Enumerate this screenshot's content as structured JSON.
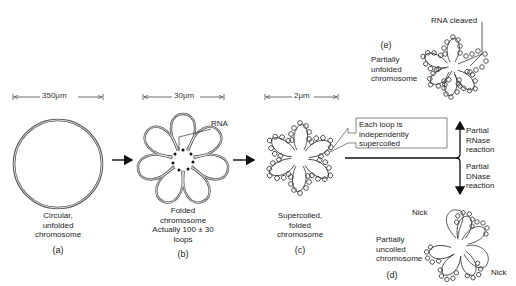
{
  "figure": {
    "scale_bars": [
      {
        "id": "a",
        "label": "350μm"
      },
      {
        "id": "b",
        "label": "30μm"
      },
      {
        "id": "c",
        "label": "2μm"
      }
    ],
    "panels": {
      "a": {
        "tag": "(a)",
        "caption": [
          "Circular,",
          "unfolded",
          "chromosome"
        ]
      },
      "b": {
        "tag": "(b)",
        "caption": [
          "Folded",
          "chromosome",
          "Actually 100 ± 30",
          "loops"
        ],
        "pointer_label": "RNA"
      },
      "c": {
        "tag": "(c)",
        "caption": [
          "Supercoiled,",
          "folded",
          "chromosome"
        ]
      },
      "d": {
        "tag": "(d)",
        "caption": [
          "Partially",
          "uncoiled",
          "chromosome"
        ],
        "nick_labels": [
          "Nick",
          "Nick"
        ]
      },
      "e": {
        "tag": "(e)",
        "caption": [
          "Partially",
          "unfolded",
          "chromosome"
        ],
        "pointer_label": "RNA cleaved"
      }
    },
    "callout": {
      "lines": [
        "Each loop is",
        "independently",
        "supercoiled"
      ]
    },
    "branch_labels": {
      "up": [
        "Partial",
        "RNase",
        "reaction"
      ],
      "down": [
        "Partial",
        "DNase",
        "reaction"
      ]
    }
  }
}
